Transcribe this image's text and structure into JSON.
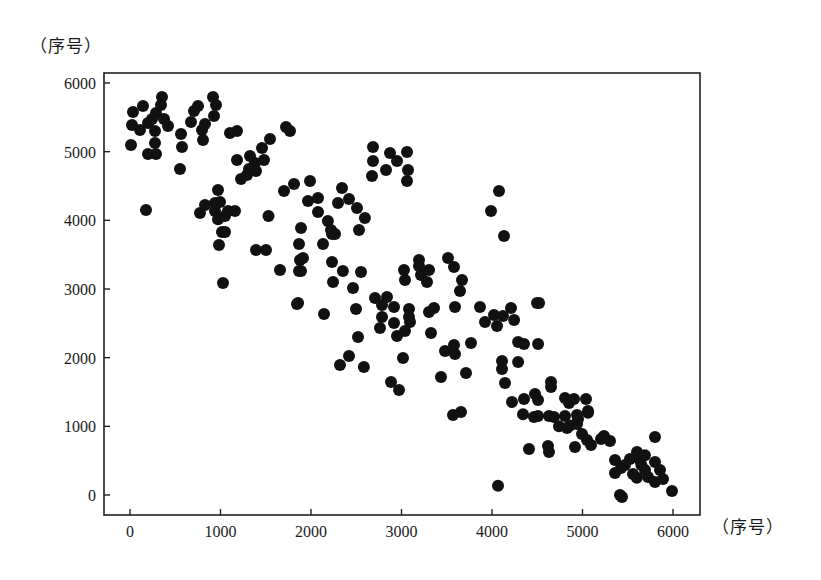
{
  "chart_data": {
    "type": "scatter",
    "title": "",
    "xlabel": "（序号）",
    "ylabel": "（序号）",
    "xlim": [
      -280,
      6300
    ],
    "ylim": [
      -290,
      6150
    ],
    "x_ticks": [
      0,
      1000,
      2000,
      3000,
      4000,
      5000,
      6000
    ],
    "y_ticks": [
      0,
      1000,
      2000,
      3000,
      4000,
      5000,
      6000
    ],
    "grid": false,
    "legend": null,
    "marker": {
      "shape": "circle",
      "color": "#111111",
      "radius_px": 6
    },
    "points": [
      [
        11,
        5095
      ],
      [
        22,
        5388
      ],
      [
        33,
        5577
      ],
      [
        144,
        5664
      ],
      [
        111,
        5315
      ],
      [
        199,
        5417
      ],
      [
        243,
        5475
      ],
      [
        287,
        5563
      ],
      [
        343,
        5679
      ],
      [
        354,
        5796
      ],
      [
        376,
        5475
      ],
      [
        276,
        5300
      ],
      [
        276,
        5125
      ],
      [
        287,
        4965
      ],
      [
        199,
        4965
      ],
      [
        420,
        5373
      ],
      [
        564,
        5257
      ],
      [
        575,
        5067
      ],
      [
        553,
        4747
      ],
      [
        674,
        5431
      ],
      [
        707,
        5591
      ],
      [
        751,
        5664
      ],
      [
        917,
        5796
      ],
      [
        950,
        5679
      ],
      [
        928,
        5519
      ],
      [
        829,
        5402
      ],
      [
        796,
        5315
      ],
      [
        807,
        5169
      ],
      [
        1105,
        5271
      ],
      [
        177,
        4149
      ],
      [
        994,
        4266
      ],
      [
        1083,
        4135
      ],
      [
        1017,
        3829
      ],
      [
        983,
        3640
      ],
      [
        1028,
        3086
      ],
      [
        1182,
        5300
      ],
      [
        1724,
        5358
      ],
      [
        1768,
        5300
      ],
      [
        1547,
        5184
      ],
      [
        1459,
        5053
      ],
      [
        1381,
        4834
      ],
      [
        1326,
        4936
      ],
      [
        1481,
        4878
      ],
      [
        1182,
        4878
      ],
      [
        1315,
        4747
      ],
      [
        1293,
        4659
      ],
      [
        1227,
        4601
      ],
      [
        1392,
        4718
      ],
      [
        972,
        4441
      ],
      [
        939,
        4251
      ],
      [
        829,
        4222
      ],
      [
        939,
        4135
      ],
      [
        1050,
        4061
      ],
      [
        1160,
        4135
      ],
      [
        972,
        4017
      ],
      [
        773,
        4106
      ],
      [
        1050,
        3829
      ],
      [
        1530,
        4061
      ],
      [
        1702,
        4426
      ],
      [
        1812,
        4528
      ],
      [
        1392,
        3567
      ],
      [
        1503,
        3567
      ],
      [
        1657,
        3276
      ],
      [
        1867,
        3654
      ],
      [
        1879,
        3421
      ],
      [
        1867,
        3261
      ],
      [
        1845,
        2781
      ],
      [
        1989,
        4571
      ],
      [
        1967,
        4280
      ],
      [
        2077,
        4324
      ],
      [
        2077,
        4120
      ],
      [
        2298,
        4251
      ],
      [
        2187,
        3989
      ],
      [
        2265,
        3800
      ],
      [
        2221,
        3858
      ],
      [
        2232,
        3800
      ],
      [
        2420,
        4309
      ],
      [
        2508,
        4178
      ],
      [
        2596,
        4033
      ],
      [
        2530,
        3858
      ],
      [
        1890,
        3887
      ],
      [
        2133,
        3654
      ],
      [
        1912,
        3450
      ],
      [
        1890,
        3261
      ],
      [
        2353,
        3261
      ],
      [
        2232,
        3392
      ],
      [
        2243,
        3101
      ],
      [
        2552,
        3246
      ],
      [
        2464,
        3014
      ],
      [
        1857,
        2795
      ],
      [
        2144,
        2635
      ],
      [
        2707,
        2868
      ],
      [
        2784,
        2766
      ],
      [
        2784,
        2591
      ],
      [
        2497,
        2708
      ],
      [
        2762,
        2431
      ],
      [
        2840,
        2882
      ],
      [
        2917,
        2737
      ],
      [
        2917,
        2504
      ],
      [
        2950,
        2315
      ],
      [
        2519,
        2300
      ],
      [
        2420,
        2024
      ],
      [
        2320,
        1893
      ],
      [
        2972,
        1529
      ],
      [
        2884,
        1645
      ],
      [
        3028,
        3276
      ],
      [
        3039,
        3130
      ],
      [
        3083,
        2708
      ],
      [
        3083,
        2591
      ],
      [
        3094,
        2518
      ],
      [
        3039,
        2388
      ],
      [
        3193,
        3421
      ],
      [
        3193,
        3333
      ],
      [
        3215,
        3203
      ],
      [
        3304,
        3276
      ],
      [
        3282,
        3101
      ],
      [
        3514,
        3450
      ],
      [
        3580,
        3319
      ],
      [
        3668,
        3130
      ],
      [
        3646,
        2970
      ],
      [
        3359,
        2722
      ],
      [
        3304,
        2664
      ],
      [
        3591,
        2737
      ],
      [
        3326,
        2358
      ],
      [
        3481,
        2096
      ],
      [
        3580,
        2184
      ],
      [
        3591,
        2053
      ],
      [
        3768,
        2213
      ],
      [
        3017,
        1995
      ],
      [
        2585,
        1863
      ],
      [
        3436,
        1718
      ],
      [
        3713,
        1776
      ],
      [
        3657,
        1209
      ],
      [
        3569,
        1165
      ],
      [
        2685,
        5067
      ],
      [
        2685,
        4862
      ],
      [
        2674,
        4644
      ],
      [
        2873,
        4980
      ],
      [
        2950,
        4862
      ],
      [
        2829,
        4731
      ],
      [
        3061,
        4994
      ],
      [
        3072,
        4732
      ],
      [
        3061,
        4571
      ],
      [
        2343,
        4469
      ],
      [
        4077,
        4426
      ],
      [
        3989,
        4135
      ],
      [
        4133,
        3771
      ],
      [
        3867,
        2737
      ],
      [
        4022,
        2620
      ],
      [
        4055,
        2460
      ],
      [
        4122,
        2606
      ],
      [
        4210,
        2722
      ],
      [
        4244,
        2547
      ],
      [
        3923,
        2518
      ],
      [
        4288,
        2227
      ],
      [
        4288,
        1937
      ],
      [
        4111,
        1950
      ],
      [
        4111,
        1834
      ],
      [
        4520,
        2795
      ],
      [
        4509,
        2198
      ],
      [
        4354,
        2198
      ],
      [
        4144,
        1631
      ],
      [
        4354,
        1398
      ],
      [
        4652,
        1645
      ],
      [
        4807,
        1412
      ],
      [
        4851,
        1340
      ],
      [
        4807,
        1150
      ],
      [
        4939,
        1165
      ],
      [
        5061,
        1198
      ],
      [
        4343,
        1176
      ],
      [
        4464,
        1135
      ],
      [
        4630,
        1150
      ],
      [
        4740,
        1000
      ],
      [
        4862,
        1012
      ],
      [
        4619,
        713
      ],
      [
        4917,
        699
      ],
      [
        4409,
        669
      ],
      [
        4630,
        626
      ],
      [
        4221,
        1355
      ],
      [
        4497,
        2795
      ],
      [
        4475,
        1470
      ],
      [
        4652,
        1572
      ],
      [
        4508,
        1383
      ],
      [
        4508,
        1150
      ],
      [
        4685,
        1135
      ],
      [
        4906,
        1398
      ],
      [
        5039,
        1398
      ],
      [
        5061,
        1222
      ],
      [
        5050,
        801
      ],
      [
        5094,
        728
      ],
      [
        5204,
        815
      ],
      [
        4994,
        888
      ],
      [
        4829,
        976
      ],
      [
        4939,
        1033
      ],
      [
        4950,
        1106
      ],
      [
        5238,
        859
      ],
      [
        5304,
        786
      ],
      [
        4066,
        136
      ],
      [
        5801,
        844
      ],
      [
        5359,
        510
      ],
      [
        5425,
        393
      ],
      [
        5470,
        437
      ],
      [
        5525,
        524
      ],
      [
        5602,
        626
      ],
      [
        5635,
        510
      ],
      [
        5359,
        320
      ],
      [
        5558,
        306
      ],
      [
        5691,
        364
      ],
      [
        5801,
        480
      ],
      [
        5856,
        364
      ],
      [
        5724,
        262
      ],
      [
        5801,
        189
      ],
      [
        5890,
        233
      ],
      [
        5989,
        58
      ],
      [
        5436,
        -29
      ],
      [
        5414,
        0
      ],
      [
        5650,
        436
      ],
      [
        5690,
        580
      ],
      [
        5600,
        250
      ]
    ]
  },
  "axis_labels": {
    "y_unit": "（序号）",
    "x_unit": "（序号）",
    "x_ticks": [
      "0",
      "1000",
      "2000",
      "3000",
      "4000",
      "5000",
      "6000"
    ],
    "y_ticks": [
      "0",
      "1000",
      "2000",
      "3000",
      "4000",
      "5000",
      "6000"
    ]
  }
}
